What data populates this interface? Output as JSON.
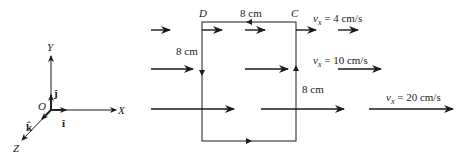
{
  "axes": {
    "x_label": "X",
    "y_label": "Y",
    "z_label": "Z",
    "origin_label": "O",
    "i_hat": "î",
    "j_hat": "ĵ",
    "k_hat": "k̂"
  },
  "loop": {
    "corners": {
      "A": "A",
      "B": "B",
      "C": "C",
      "D": "D"
    },
    "side_top": "8 cm",
    "side_left": "8 cm",
    "side_right": "8 cm",
    "side_bottom": "8 cm"
  },
  "velocities": [
    {
      "symbol": "v",
      "sub": "x",
      "text": " = 4 cm/s"
    },
    {
      "symbol": "v",
      "sub": "x",
      "text": " = 10 cm/s"
    },
    {
      "symbol": "v",
      "sub": "x",
      "text": " = 20 cm/s"
    }
  ],
  "colors": {
    "ink": "#1a1a1a",
    "background": "#ffffff"
  }
}
